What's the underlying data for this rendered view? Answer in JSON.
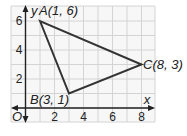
{
  "figure": {
    "type": "coordinate-plane-triangle",
    "axes": {
      "x_label": "x",
      "y_label": "y",
      "origin_label": "O",
      "x_ticks": [
        "2",
        "4",
        "6",
        "8"
      ],
      "y_ticks": [
        "2",
        "4",
        "6"
      ]
    },
    "points": [
      {
        "name": "A",
        "x": 1,
        "y": 6,
        "label": "A(1, 6)"
      },
      {
        "name": "B",
        "x": 3,
        "y": 1,
        "label": "B(3, 1)"
      },
      {
        "name": "C",
        "x": 8,
        "y": 3,
        "label": "C(8, 3)"
      }
    ],
    "colors": {
      "grid": "#d4d4d4",
      "grid_fill": "#f7f7f7",
      "axis": "#222222",
      "triangle": "#333333"
    }
  }
}
